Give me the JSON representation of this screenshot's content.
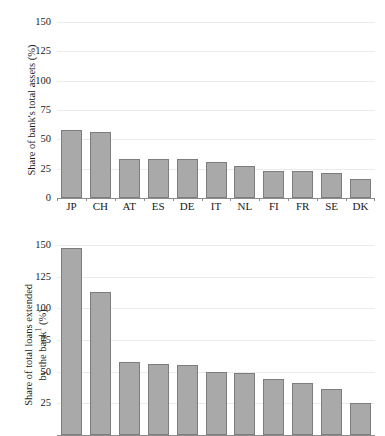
{
  "chart_data": [
    {
      "type": "bar",
      "panel": "top",
      "title": "",
      "xlabel": "",
      "ylabel": "Share of bank's total assets (%)",
      "ylim": [
        0,
        150
      ],
      "yticks": [
        0,
        25,
        50,
        75,
        100,
        125,
        150
      ],
      "ytick_labels": [
        "0",
        "25",
        "50",
        "75",
        "100",
        "125",
        "150"
      ],
      "grid": true,
      "legend": "none",
      "categories": [
        "JP",
        "CH",
        "AT",
        "ES",
        "DE",
        "IT",
        "NL",
        "FI",
        "FR",
        "SE",
        "DK"
      ],
      "values": [
        58,
        56,
        33,
        33,
        33,
        31,
        27,
        23,
        23,
        21,
        16
      ]
    },
    {
      "type": "bar",
      "panel": "bottom",
      "title": "",
      "xlabel": "",
      "ylabel_line1": "Share of total loans extended",
      "ylabel_line2": "by the bank",
      "ylabel_footnote": "1",
      "ylabel_units": " (%)",
      "ylim": [
        0,
        150
      ],
      "yticks": [
        0,
        25,
        50,
        75,
        100,
        125,
        150
      ],
      "ytick_labels": [
        "0",
        "25",
        "50",
        "75",
        "100",
        "125",
        "150"
      ],
      "visible_ytick_labels": [
        "25",
        "50",
        "75",
        "100",
        "125",
        "150"
      ],
      "grid": true,
      "legend": "none",
      "clipped_at_bottom": true,
      "categories": [
        "JP",
        "CH",
        "AT",
        "ES",
        "DE",
        "IT",
        "NL",
        "FI",
        "FR",
        "SE",
        "DK"
      ],
      "values": [
        148,
        113,
        58,
        56,
        55,
        50,
        49,
        44,
        41,
        36,
        25
      ]
    }
  ],
  "style": {
    "bar_fill": "#a9a9a9",
    "bar_edge": "#7d7d7d",
    "gridline": "#ebebeb",
    "axis": "#8c8c8c",
    "text": "#1a1a1a",
    "background": "#ffffff"
  }
}
